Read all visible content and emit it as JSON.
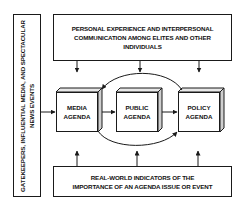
{
  "diagram": {
    "left_box": {
      "text": "GATEKEEPERS, INFLUENTIAL MEDIA, AND SPECTACULAR NEWS EVENTS"
    },
    "top_box": {
      "line1": "PERSONAL EXPERIENCE AND INTERPERSONAL",
      "line2": "COMMUNICATION AMONG ELITES AND OTHER",
      "line3": "INDIVIDUALS"
    },
    "agendas": [
      {
        "line1": "MEDIA",
        "line2": "AGENDA"
      },
      {
        "line1": "PUBLIC",
        "line2": "AGENDA"
      },
      {
        "line1": "POLICY",
        "line2": "AGENDA"
      }
    ],
    "bottom_box": {
      "line1": "REAL-WORLD INDICATORS OF THE",
      "line2": "IMPORTANCE OF AN AGENDA ISSUE OR EVENT"
    },
    "colors": {
      "stroke": "#1a1a1a",
      "background": "#ffffff",
      "box_side": "#d9d9d9"
    }
  }
}
